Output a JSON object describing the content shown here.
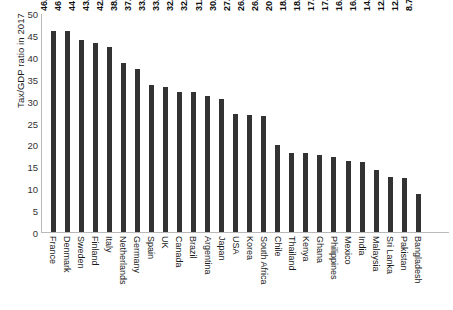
{
  "chart_data": {
    "type": "bar",
    "title": "",
    "xlabel": "",
    "ylabel": "Tax/GDP ratio in 2017",
    "ylim": [
      0,
      50
    ],
    "yticks": [
      50,
      45,
      40,
      35,
      30,
      25,
      20,
      15,
      10,
      5,
      0
    ],
    "grid": false,
    "legend": false,
    "bar_color": "#333333",
    "background_color": "#ffffff",
    "value_labels": true,
    "categories": [
      "France",
      "Denmark",
      "Sweden",
      "Finland",
      "Italy",
      "Netherlands",
      "Germany",
      "Spain",
      "UK",
      "Canada",
      "Brazil",
      "Argentina",
      "Japan",
      "USA",
      "Korea",
      "South Africa",
      "Chile",
      "Thailand",
      "Kenya",
      "Ghana",
      "Philippines",
      "Mexico",
      "India",
      "Malaysia",
      "Sri Lanka",
      "Pakistan",
      "Bangladesh"
    ],
    "values": [
      46.2,
      46,
      44,
      43.3,
      42.4,
      38.8,
      37.5,
      33.7,
      33.3,
      32.2,
      32.2,
      31.3,
      30.6,
      27.1,
      26.9,
      26.6,
      20,
      18.1,
      18.1,
      17.6,
      17.1,
      16.2,
      16.1,
      14.3,
      12.6,
      12.4,
      8.7
    ],
    "value_label_texts": [
      "46.2",
      "46",
      "44",
      "43.3",
      "42.4",
      "38.8",
      "37.5",
      "33.7",
      "33.3",
      "32.2",
      "32.2",
      "31.3",
      "30.6",
      "27.1",
      "26.9",
      "26.6",
      "20",
      "18.1",
      "18.1",
      "17.6",
      "17.1",
      "16.2",
      "16.1",
      "14.3",
      "12.6",
      "12.4",
      "8.7"
    ]
  },
  "caption": ""
}
